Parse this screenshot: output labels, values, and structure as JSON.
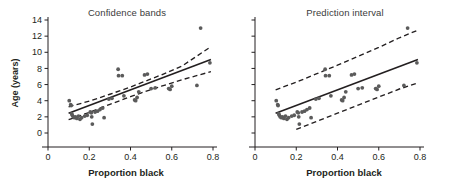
{
  "figure": {
    "width": 457,
    "height": 182,
    "background": "#ffffff",
    "ink_color": "#231f20",
    "point_color": "#5b5b5b",
    "title_color": "#3b3b3b"
  },
  "chart_data": [
    {
      "type": "scatter",
      "panel_id": "left",
      "title": "Confidence bands",
      "xlabel": "Proportion black",
      "ylabel": "Age (years)",
      "xlim": [
        0,
        0.8
      ],
      "ylim": [
        0,
        14
      ],
      "xticks": [
        0,
        0.2,
        0.4,
        0.6,
        0.8
      ],
      "xtick_labels": [
        "0",
        "0.2",
        "0.4",
        "0.6",
        "0.8"
      ],
      "yticks": [
        0,
        2,
        4,
        6,
        8,
        10,
        12,
        14
      ],
      "ytick_labels": [
        "0",
        "2",
        "4",
        "6",
        "8",
        "10",
        "12",
        "14"
      ],
      "grid": false,
      "legend": "none",
      "x": [
        0.103,
        0.11,
        0.112,
        0.115,
        0.118,
        0.122,
        0.128,
        0.133,
        0.14,
        0.148,
        0.155,
        0.163,
        0.178,
        0.19,
        0.205,
        0.21,
        0.212,
        0.215,
        0.228,
        0.24,
        0.252,
        0.265,
        0.272,
        0.295,
        0.31,
        0.34,
        0.342,
        0.36,
        0.368,
        0.42,
        0.425,
        0.432,
        0.44,
        0.468,
        0.482,
        0.5,
        0.52,
        0.585,
        0.592,
        0.6,
        0.722,
        0.74,
        0.785
      ],
      "y": [
        4.0,
        3.5,
        3.4,
        2.4,
        2.2,
        2.0,
        1.9,
        2.0,
        1.8,
        2.1,
        1.7,
        1.9,
        2.1,
        2.2,
        2.6,
        2.5,
        2.0,
        1.1,
        2.6,
        2.7,
        2.9,
        3.1,
        1.9,
        4.2,
        4.3,
        7.9,
        7.1,
        7.1,
        4.6,
        4.1,
        4.0,
        4.4,
        5.1,
        7.2,
        7.3,
        5.5,
        5.6,
        5.5,
        5.4,
        5.8,
        5.9,
        13.0,
        8.7
      ],
      "regression_line": {
        "label": "fitted line",
        "style": "solid",
        "x": [
          0.1,
          0.79
        ],
        "y": [
          2.45,
          9.1
        ]
      },
      "bands": {
        "label": "95% confidence bands",
        "style": "dashed",
        "kind": "confidence",
        "x": [
          0.1,
          0.2,
          0.3,
          0.4,
          0.45,
          0.55,
          0.65,
          0.79
        ],
        "upper": [
          3.25,
          3.95,
          4.8,
          5.7,
          6.2,
          7.2,
          8.3,
          10.7
        ],
        "lower": [
          1.65,
          2.55,
          3.55,
          4.5,
          4.95,
          5.8,
          6.6,
          7.6
        ]
      }
    },
    {
      "type": "scatter",
      "panel_id": "right",
      "title": "Prediction interval",
      "xlabel": "Proportion black",
      "ylabel": "Age (years)",
      "xlim": [
        0,
        0.8
      ],
      "ylim": [
        0,
        14
      ],
      "xticks": [
        0,
        0.2,
        0.4,
        0.6,
        0.8
      ],
      "xtick_labels": [
        "0",
        "0.2",
        "0.4",
        "0.6",
        "0.8"
      ],
      "yticks": [
        0,
        2,
        4,
        6,
        8,
        10,
        12,
        14
      ],
      "ytick_labels": [],
      "grid": false,
      "legend": "none",
      "x": [
        0.103,
        0.11,
        0.112,
        0.115,
        0.118,
        0.122,
        0.128,
        0.133,
        0.14,
        0.148,
        0.155,
        0.163,
        0.178,
        0.19,
        0.205,
        0.21,
        0.212,
        0.215,
        0.228,
        0.24,
        0.252,
        0.265,
        0.272,
        0.295,
        0.31,
        0.34,
        0.342,
        0.36,
        0.368,
        0.42,
        0.425,
        0.432,
        0.44,
        0.468,
        0.482,
        0.5,
        0.52,
        0.585,
        0.592,
        0.6,
        0.722,
        0.74,
        0.785
      ],
      "y": [
        4.0,
        3.5,
        3.4,
        2.4,
        2.2,
        2.0,
        1.9,
        2.0,
        1.8,
        2.1,
        1.7,
        1.9,
        2.1,
        2.2,
        2.6,
        2.5,
        2.0,
        1.1,
        2.6,
        2.7,
        2.9,
        3.1,
        1.9,
        4.2,
        4.3,
        7.9,
        7.1,
        7.1,
        4.6,
        4.1,
        4.0,
        4.4,
        5.1,
        7.2,
        7.3,
        5.5,
        5.6,
        5.5,
        5.4,
        5.8,
        5.9,
        13.0,
        8.7
      ],
      "regression_line": {
        "label": "fitted line",
        "style": "solid",
        "x": [
          0.1,
          0.79
        ],
        "y": [
          2.45,
          9.1
        ]
      },
      "bands": {
        "label": "95% prediction interval",
        "style": "dashed",
        "kind": "prediction",
        "x": [
          0.1,
          0.2,
          0.3,
          0.4,
          0.5,
          0.6,
          0.7,
          0.79
        ],
        "upper": [
          5.35,
          6.3,
          7.35,
          8.4,
          9.5,
          10.6,
          11.8,
          12.75
        ],
        "lower": [
          -0.45,
          0.45,
          1.45,
          2.45,
          3.45,
          4.45,
          5.45,
          6.2
        ]
      }
    }
  ]
}
